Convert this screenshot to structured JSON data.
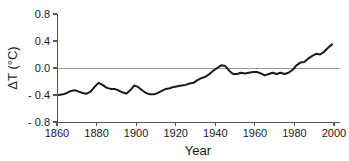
{
  "chart_data": {
    "type": "line",
    "title": "",
    "subtitle": "",
    "xlabel": "Year",
    "ylabel": "ΔT (°C)",
    "xlim": [
      1860,
      2000
    ],
    "ylim": [
      -0.8,
      0.8
    ],
    "xticks": [
      1860,
      1880,
      1900,
      1920,
      1940,
      1960,
      1980,
      2000
    ],
    "xtick_labels": [
      "1860",
      "1880",
      "1900",
      "1920",
      "1940",
      "1960",
      "1980",
      "2000"
    ],
    "yticks": [
      -0.8,
      -0.4,
      0.0,
      0.4,
      0.8
    ],
    "ytick_labels": [
      "- 0.8",
      "- 0.4",
      "0.0",
      "0.4",
      "0.8"
    ],
    "grid": false,
    "legend": null,
    "annotations": [
      {
        "name": "zero-reference-line",
        "type": "hline",
        "y": 0.0,
        "color": "#9a9a9a"
      }
    ],
    "line_color": "#1a1a1a",
    "axis_color": "#555555",
    "series": [
      {
        "name": "global-temperature-anomaly",
        "x": [
          1861,
          1863,
          1865,
          1867,
          1869,
          1871,
          1873,
          1875,
          1877,
          1879,
          1881,
          1883,
          1885,
          1887,
          1889,
          1891,
          1893,
          1895,
          1897,
          1899,
          1901,
          1903,
          1905,
          1907,
          1909,
          1911,
          1913,
          1915,
          1917,
          1919,
          1921,
          1923,
          1925,
          1927,
          1929,
          1931,
          1933,
          1935,
          1937,
          1939,
          1941,
          1943,
          1945,
          1947,
          1949,
          1951,
          1953,
          1955,
          1957,
          1959,
          1961,
          1963,
          1965,
          1967,
          1969,
          1971,
          1973,
          1975,
          1977,
          1979,
          1981,
          1983,
          1985,
          1987,
          1989,
          1991,
          1993,
          1995,
          1997,
          1999
        ],
        "y": [
          -0.4,
          -0.39,
          -0.37,
          -0.34,
          -0.33,
          -0.35,
          -0.37,
          -0.38,
          -0.35,
          -0.28,
          -0.22,
          -0.25,
          -0.29,
          -0.31,
          -0.31,
          -0.33,
          -0.36,
          -0.38,
          -0.33,
          -0.26,
          -0.28,
          -0.33,
          -0.37,
          -0.39,
          -0.39,
          -0.37,
          -0.34,
          -0.31,
          -0.3,
          -0.28,
          -0.27,
          -0.26,
          -0.25,
          -0.23,
          -0.22,
          -0.18,
          -0.15,
          -0.13,
          -0.09,
          -0.04,
          0.0,
          0.04,
          0.03,
          -0.04,
          -0.09,
          -0.09,
          -0.07,
          -0.08,
          -0.07,
          -0.06,
          -0.06,
          -0.08,
          -0.11,
          -0.09,
          -0.07,
          -0.09,
          -0.07,
          -0.09,
          -0.07,
          -0.03,
          0.04,
          0.08,
          0.09,
          0.14,
          0.18,
          0.21,
          0.2,
          0.24,
          0.3,
          0.35
        ],
        "units": "°C"
      }
    ]
  },
  "layout": {
    "plot_left_px": 57,
    "plot_right_px": 334,
    "plot_top_px": 14,
    "plot_bottom_px": 122
  }
}
